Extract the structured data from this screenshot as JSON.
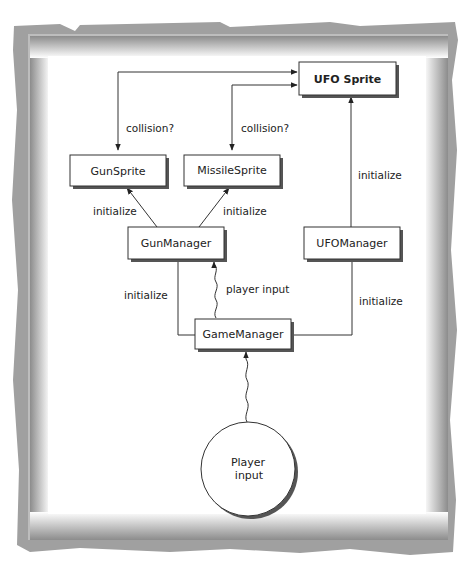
{
  "nodes": {
    "ufo_sprite": {
      "label": "UFO Sprite"
    },
    "gun_sprite": {
      "label": "GunSprite"
    },
    "missile_sprite": {
      "label": "MissileSprite"
    },
    "gun_manager": {
      "label": "GunManager"
    },
    "ufo_manager": {
      "label": "UFOManager"
    },
    "game_manager": {
      "label": "GameManager"
    },
    "player_input": {
      "label_line1": "Player",
      "label_line2": "input"
    }
  },
  "edges": {
    "gun_collision": "collision?",
    "missile_collision": "collision?",
    "ufo_init": "initialize",
    "gunsprite_init": "initialize",
    "missilesprite_init": "initialize",
    "gunmanager_init": "initialize",
    "player_input_msg": "player input",
    "ufomanager_init": "initialize"
  }
}
